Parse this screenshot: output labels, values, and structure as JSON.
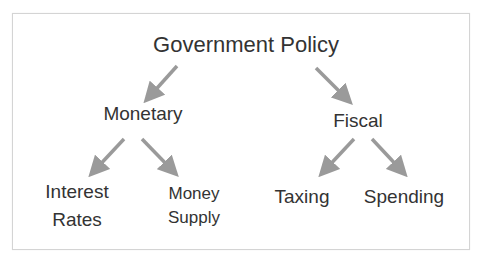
{
  "diagram": {
    "type": "tree",
    "root": {
      "label": "Government Policy"
    },
    "branches": [
      {
        "label": "Monetary",
        "children": [
          {
            "line1": "Interest",
            "line2": "Rates"
          },
          {
            "line1": "Money",
            "line2": "Supply"
          }
        ]
      },
      {
        "label": "Fiscal",
        "children": [
          {
            "line1": "Taxing"
          },
          {
            "line1": "Spending"
          }
        ]
      }
    ],
    "colors": {
      "text": "#333333",
      "arrow": "#9a9a9a",
      "border": "#d4d4d4",
      "background": "#ffffff"
    }
  }
}
